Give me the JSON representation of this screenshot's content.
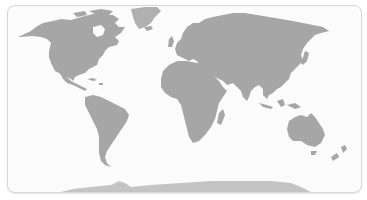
{
  "map": {
    "projection": "world political-style silhouette",
    "land_color": "#a6a6a6",
    "ocean_color": "#fbfbfb",
    "antarctica_color": "#c4c4c4",
    "greenland_color": "#b3b3b3",
    "border_color": "#d8d8d8",
    "regions": [
      "north-america",
      "greenland",
      "south-america",
      "europe",
      "africa",
      "asia",
      "australia",
      "new-zealand",
      "antarctica",
      "indonesia",
      "japan",
      "madagascar",
      "uk",
      "iceland",
      "caribbean"
    ]
  }
}
